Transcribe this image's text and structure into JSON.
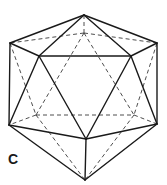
{
  "figure": {
    "label": "C",
    "colors": {
      "background": "#ffffff",
      "solid_edge": "#1a1a1a",
      "dashed_edge": "#3a3a3a"
    },
    "vertices": {
      "top": [
        84,
        15
      ],
      "upper_left_outer": [
        10,
        43
      ],
      "upper_right_outer": [
        157,
        43
      ],
      "upper_left_front": [
        39,
        56
      ],
      "upper_right_front": [
        131,
        56
      ],
      "back_top": [
        84,
        33
      ],
      "lower_left_outer": [
        9,
        125
      ],
      "lower_right_outer": [
        157,
        124
      ],
      "lower_center_front": [
        86,
        139
      ],
      "back_lower_left": [
        36,
        115
      ],
      "back_lower_right": [
        134,
        115
      ],
      "bottom": [
        85,
        180
      ]
    },
    "solid_edges": [
      [
        "top",
        "upper_left_outer"
      ],
      [
        "top",
        "upper_right_outer"
      ],
      [
        "top",
        "upper_left_front"
      ],
      [
        "top",
        "upper_right_front"
      ],
      [
        "upper_left_outer",
        "upper_left_front"
      ],
      [
        "upper_right_outer",
        "upper_right_front"
      ],
      [
        "upper_left_front",
        "upper_right_front"
      ],
      [
        "upper_left_outer",
        "lower_left_outer"
      ],
      [
        "upper_right_outer",
        "lower_right_outer"
      ],
      [
        "upper_left_front",
        "lower_left_outer"
      ],
      [
        "upper_right_front",
        "lower_right_outer"
      ],
      [
        "upper_left_front",
        "lower_center_front"
      ],
      [
        "upper_right_front",
        "lower_center_front"
      ],
      [
        "lower_left_outer",
        "lower_center_front"
      ],
      [
        "lower_right_outer",
        "lower_center_front"
      ],
      [
        "lower_left_outer",
        "bottom"
      ],
      [
        "lower_right_outer",
        "bottom"
      ],
      [
        "lower_center_front",
        "bottom"
      ]
    ],
    "dashed_edges": [
      [
        "top",
        "back_top"
      ],
      [
        "back_top",
        "upper_left_outer"
      ],
      [
        "back_top",
        "upper_right_outer"
      ],
      [
        "back_top",
        "back_lower_left"
      ],
      [
        "back_top",
        "back_lower_right"
      ],
      [
        "upper_left_outer",
        "back_lower_left"
      ],
      [
        "upper_right_outer",
        "back_lower_right"
      ],
      [
        "back_lower_left",
        "back_lower_right"
      ],
      [
        "back_lower_left",
        "lower_left_outer"
      ],
      [
        "back_lower_right",
        "lower_right_outer"
      ],
      [
        "back_lower_left",
        "bottom"
      ],
      [
        "back_lower_right",
        "bottom"
      ]
    ]
  }
}
